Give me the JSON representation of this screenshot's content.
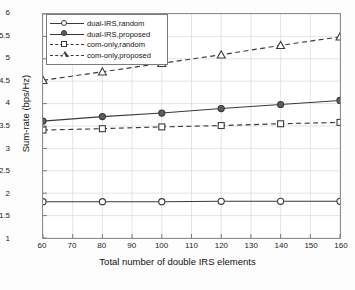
{
  "chart_data": {
    "type": "line",
    "title": "",
    "xlabel": "Total number of double IRS elements",
    "ylabel": "Sum-rate (bps/Hz)",
    "xlim": [
      60,
      160
    ],
    "ylim": [
      1,
      6
    ],
    "xticks": [
      60,
      70,
      80,
      90,
      100,
      110,
      120,
      130,
      140,
      150,
      160
    ],
    "xtick_labels": [
      "60",
      "70",
      "80",
      "90",
      "100",
      "110",
      "120",
      "130",
      "140",
      "150",
      "160"
    ],
    "yticks": [
      1,
      1.5,
      2,
      2.5,
      3,
      3.5,
      4,
      4.5,
      5,
      5.5,
      6
    ],
    "ytick_labels": [
      "1",
      "1.5",
      "2",
      "2.5",
      "3",
      "3.5",
      "4",
      "4.5",
      "5",
      "5.5",
      "6"
    ],
    "grid": true,
    "legend_position": "upper left",
    "x": [
      60,
      80,
      100,
      120,
      140,
      160
    ],
    "series": [
      {
        "name": "dual-IRS,random",
        "label": "dual-IRS,random",
        "values": [
          1.81,
          1.81,
          1.81,
          1.82,
          1.82,
          1.82
        ],
        "linestyle": "solid",
        "marker": "circle-open",
        "color": "#3a3a3a"
      },
      {
        "name": "dual-IRS,proposed",
        "label": "dual-IRS,proposed",
        "values": [
          3.61,
          3.71,
          3.79,
          3.89,
          3.98,
          4.07
        ],
        "linestyle": "solid",
        "marker": "circle-filled",
        "color": "#3a3a3a"
      },
      {
        "name": "com-only,random",
        "label": "com-only,random",
        "values": [
          3.41,
          3.44,
          3.48,
          3.51,
          3.55,
          3.58
        ],
        "linestyle": "dashed",
        "marker": "square-open",
        "color": "#3a3a3a"
      },
      {
        "name": "com-only,proposed",
        "label": "com-only,proposed",
        "values": [
          4.52,
          4.71,
          4.9,
          5.09,
          5.3,
          5.49
        ],
        "linestyle": "dashed",
        "marker": "triangle-open",
        "color": "#3a3a3a"
      }
    ]
  }
}
